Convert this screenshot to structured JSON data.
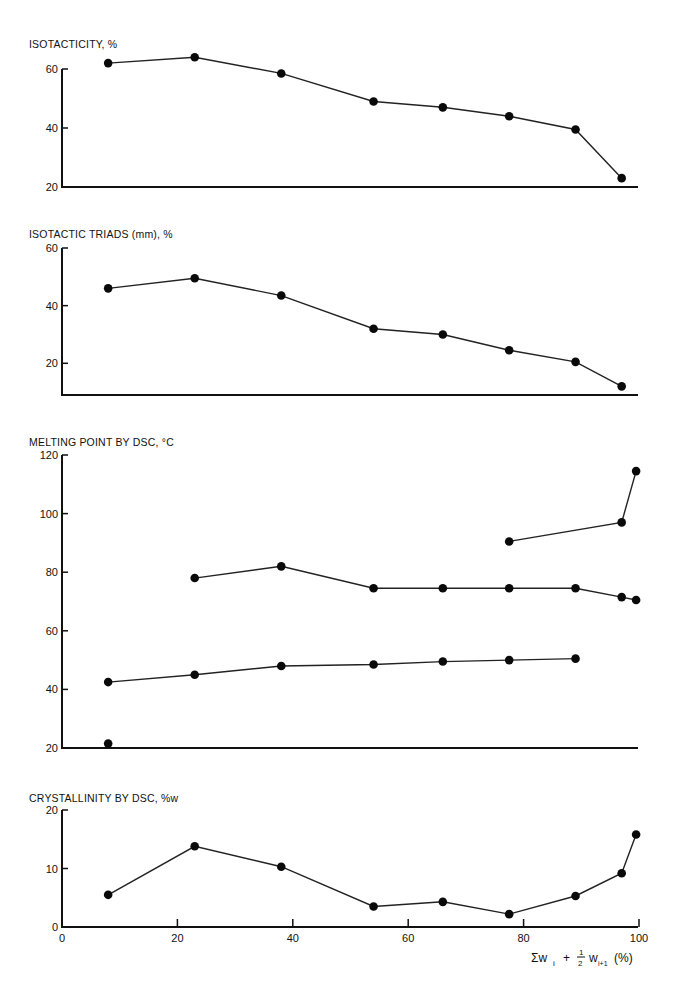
{
  "chart_data": [
    {
      "type": "line",
      "title": "ISOTACTICITY, %",
      "xlabel": "",
      "ylabel": "ISOTACTICITY, %",
      "ylim": [
        20,
        60
      ],
      "yticks": [
        20,
        40,
        60
      ],
      "xlim": [
        0,
        100
      ],
      "grid": false,
      "series": [
        {
          "name": "isotacticity",
          "x": [
            8,
            23,
            38,
            54,
            66,
            77.5,
            89,
            97
          ],
          "values": [
            62,
            64,
            58.5,
            49,
            47,
            44,
            39.5,
            23
          ]
        }
      ]
    },
    {
      "type": "line",
      "title": "ISOTACTIC TRIADS (mm), %",
      "xlabel": "",
      "ylabel": "ISOTACTIC TRIADS (mm), %",
      "ylim": [
        9,
        60
      ],
      "yticks": [
        20,
        40,
        60
      ],
      "xlim": [
        0,
        100
      ],
      "grid": false,
      "series": [
        {
          "name": "isotactic triads",
          "x": [
            8,
            23,
            38,
            54,
            66,
            77.5,
            89,
            97
          ],
          "values": [
            46,
            49.5,
            43.5,
            32,
            30,
            24.5,
            20.5,
            12
          ]
        }
      ]
    },
    {
      "type": "line",
      "title": "MELTING POINT BY DSC, °C",
      "xlabel": "",
      "ylabel": "MELTING POINT BY DSC, °C",
      "ylim": [
        20,
        120
      ],
      "yticks": [
        20,
        40,
        60,
        80,
        100,
        120
      ],
      "xlim": [
        0,
        100
      ],
      "grid": false,
      "series": [
        {
          "name": "high-melting peak",
          "x": [
            77.5,
            97,
            99.5
          ],
          "values": [
            90.5,
            97,
            114.5
          ]
        },
        {
          "name": "middle peak",
          "x": [
            23,
            38,
            54,
            66,
            77.5,
            89,
            97,
            99.5
          ],
          "values": [
            78,
            82,
            74.5,
            74.5,
            74.5,
            74.5,
            71.5,
            70.5
          ]
        },
        {
          "name": "low peak",
          "x": [
            8,
            23,
            38,
            54,
            66,
            77.5,
            89
          ],
          "values": [
            42.5,
            45,
            48,
            48.5,
            49.5,
            50,
            50.5
          ]
        },
        {
          "name": "isolated point",
          "x": [
            8
          ],
          "values": [
            21.5
          ]
        }
      ]
    },
    {
      "type": "line",
      "title": "CRYSTALLINITY BY DSC, %w",
      "xlabel": "Σ wᵢ + ½ wᵢ₊₁ (%)",
      "ylabel": "CRYSTALLINITY BY DSC, %w",
      "ylim": [
        0,
        20
      ],
      "yticks": [
        0,
        10,
        20
      ],
      "xlim": [
        0,
        100
      ],
      "xticks": [
        0,
        20,
        40,
        60,
        80,
        100
      ],
      "grid": false,
      "series": [
        {
          "name": "crystallinity",
          "x": [
            8,
            23,
            38,
            54,
            66,
            77.5,
            89,
            97,
            99.5
          ],
          "values": [
            5.5,
            13.8,
            10.3,
            3.5,
            4.3,
            2.2,
            5.3,
            9.2,
            15.8
          ]
        }
      ]
    }
  ],
  "labels": {
    "panel1_title": "ISOTACTICITY, %",
    "panel2_title": "ISOTACTIC TRIADS (mm), %",
    "panel3_title": "MELTING POINT BY DSC, °C",
    "panel4_title": "CRYSTALLINITY BY DSC, %w",
    "xlabel_main": "Σw",
    "xlabel_i": "i",
    "xlabel_plus": "+",
    "xlabel_num": "1",
    "xlabel_den": "2",
    "xlabel_w": "w",
    "xlabel_i1": "i+1",
    "xlabel_unit": "(%)"
  }
}
